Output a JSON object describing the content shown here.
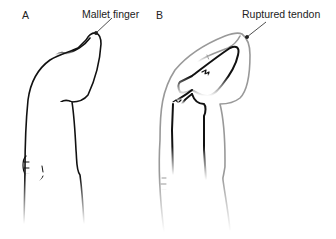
{
  "figure": {
    "panels": [
      {
        "letter": "A",
        "label": "Mallet finger"
      },
      {
        "letter": "B",
        "label": "Ruptured tendon"
      }
    ]
  }
}
